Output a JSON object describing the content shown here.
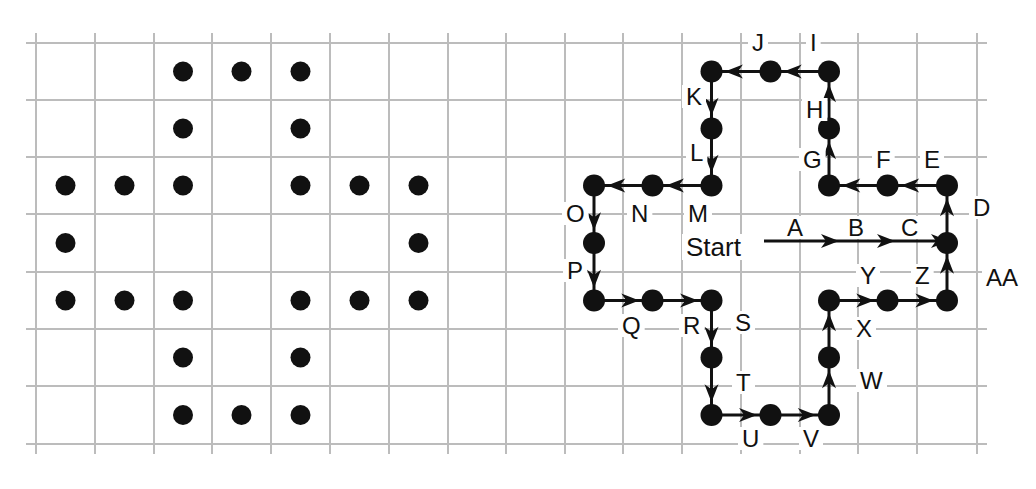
{
  "figure": {
    "colors": {
      "grid": "#bcbcbc",
      "ink": "#111111",
      "background": "#ffffff"
    }
  },
  "grid": {
    "x_lines": [
      36,
      95,
      154,
      212,
      271,
      330,
      389,
      448,
      506,
      565,
      623,
      682,
      741,
      800,
      858,
      917,
      977
    ],
    "y_lines": [
      43,
      100,
      157,
      214,
      272,
      329,
      386,
      444
    ],
    "overhang": 10
  },
  "left_pattern": {
    "name": "dot-shape",
    "dots": [
      [
        2,
        0
      ],
      [
        3,
        0
      ],
      [
        4,
        0
      ],
      [
        2,
        1
      ],
      [
        4,
        1
      ],
      [
        0,
        2
      ],
      [
        1,
        2
      ],
      [
        2,
        2
      ],
      [
        4,
        2
      ],
      [
        5,
        2
      ],
      [
        6,
        2
      ],
      [
        0,
        3
      ],
      [
        6,
        3
      ],
      [
        0,
        4
      ],
      [
        1,
        4
      ],
      [
        2,
        4
      ],
      [
        4,
        4
      ],
      [
        5,
        4
      ],
      [
        6,
        4
      ],
      [
        2,
        5
      ],
      [
        4,
        5
      ],
      [
        2,
        6
      ],
      [
        3,
        6
      ],
      [
        4,
        6
      ]
    ]
  },
  "right_pattern": {
    "start": {
      "label": "Start",
      "text_x": 686,
      "text_y": 256,
      "line_from_x": 764,
      "cell": [
        15,
        3
      ]
    },
    "start_arrows": [
      {
        "label": "A",
        "label_x": 787,
        "label_y": 236,
        "arrow_x": 830
      },
      {
        "label": "B",
        "label_x": 848,
        "label_y": 236,
        "arrow_x": 886
      },
      {
        "label": "C",
        "label_x": 901,
        "label_y": 236,
        "arrow_x": 940
      }
    ],
    "path_cells": [
      [
        15,
        3
      ],
      [
        15,
        2
      ],
      [
        14,
        2
      ],
      [
        13,
        2
      ],
      [
        13,
        1
      ],
      [
        13,
        0
      ],
      [
        12,
        0
      ],
      [
        11,
        0
      ],
      [
        11,
        1
      ],
      [
        11,
        2
      ],
      [
        10,
        2
      ],
      [
        9,
        2
      ],
      [
        9,
        3
      ],
      [
        9,
        4
      ],
      [
        10,
        4
      ],
      [
        11,
        4
      ],
      [
        11,
        5
      ],
      [
        11,
        6
      ],
      [
        12,
        6
      ],
      [
        13,
        6
      ],
      [
        13,
        5
      ],
      [
        13,
        4
      ],
      [
        14,
        4
      ],
      [
        15,
        4
      ],
      [
        15,
        3
      ]
    ],
    "steps": [
      {
        "label": "D",
        "x": 973,
        "y": 216
      },
      {
        "label": "E",
        "x": 924,
        "y": 168
      },
      {
        "label": "F",
        "x": 876,
        "y": 168
      },
      {
        "label": "G",
        "x": 803,
        "y": 168
      },
      {
        "label": "H",
        "x": 806,
        "y": 118
      },
      {
        "label": "I",
        "x": 810,
        "y": 51
      },
      {
        "label": "J",
        "x": 752,
        "y": 51
      },
      {
        "label": "K",
        "x": 686,
        "y": 105
      },
      {
        "label": "L",
        "x": 690,
        "y": 161
      },
      {
        "label": "M",
        "x": 688,
        "y": 222
      },
      {
        "label": "N",
        "x": 631,
        "y": 222
      },
      {
        "label": "O",
        "x": 566,
        "y": 222
      },
      {
        "label": "P",
        "x": 567,
        "y": 279
      },
      {
        "label": "Q",
        "x": 622,
        "y": 334
      },
      {
        "label": "R",
        "x": 683,
        "y": 334
      },
      {
        "label": "S",
        "x": 735,
        "y": 331
      },
      {
        "label": "T",
        "x": 736,
        "y": 391
      },
      {
        "label": "U",
        "x": 742,
        "y": 447
      },
      {
        "label": "V",
        "x": 803,
        "y": 447
      },
      {
        "label": "W",
        "x": 860,
        "y": 389
      },
      {
        "label": "X",
        "x": 856,
        "y": 337
      },
      {
        "label": "Y",
        "x": 860,
        "y": 284
      },
      {
        "label": "Z",
        "x": 915,
        "y": 284
      },
      {
        "label": "AA",
        "x": 986,
        "y": 286
      }
    ]
  }
}
